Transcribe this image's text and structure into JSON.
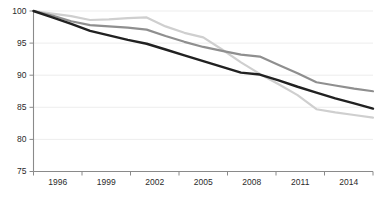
{
  "chart_data": {
    "type": "line",
    "title": "",
    "subtitle": "",
    "xlabel": "",
    "ylabel": "",
    "xlim": [
      1996,
      2014
    ],
    "ylim": [
      75,
      100
    ],
    "grid": true,
    "legend_position": "none",
    "x": [
      1996,
      1997,
      1998,
      1999,
      2000,
      2001,
      2002,
      2003,
      2004,
      2005,
      2006,
      2007,
      2008,
      2009,
      2010,
      2011,
      2012,
      2013,
      2014
    ],
    "xticks": [
      1996,
      1999,
      2002,
      2005,
      2008,
      2011,
      2014
    ],
    "xtick_labels": [
      "1996",
      "1999",
      "2002",
      "2005",
      "2008",
      "2011",
      "2014"
    ],
    "yticks": [
      75,
      80,
      85,
      90,
      95,
      100
    ],
    "ytick_labels": [
      "75",
      "80",
      "85",
      "90",
      "95",
      "100"
    ],
    "series": [
      {
        "name": "series-light-gray",
        "color": "#cfcfcf",
        "stroke_width": 2.2,
        "values": [
          100.0,
          99.6,
          99.2,
          98.6,
          98.7,
          98.9,
          99.0,
          97.6,
          96.6,
          95.9,
          94.0,
          92.0,
          90.2,
          88.6,
          86.9,
          84.7,
          84.2,
          83.8,
          83.4
        ]
      },
      {
        "name": "series-medium-gray",
        "color": "#8f8f8f",
        "stroke_width": 2.2,
        "values": [
          100.0,
          99.3,
          98.4,
          97.8,
          97.6,
          97.4,
          97.1,
          96.1,
          95.2,
          94.4,
          93.8,
          93.2,
          92.9,
          91.6,
          90.3,
          88.9,
          88.4,
          87.9,
          87.5
        ]
      },
      {
        "name": "series-dark",
        "color": "#212121",
        "stroke_width": 2.4,
        "values": [
          100.0,
          99.0,
          98.0,
          96.9,
          96.2,
          95.5,
          94.9,
          94.0,
          93.1,
          92.2,
          91.3,
          90.4,
          90.1,
          89.2,
          88.2,
          87.3,
          86.4,
          85.6,
          84.8
        ]
      }
    ]
  }
}
